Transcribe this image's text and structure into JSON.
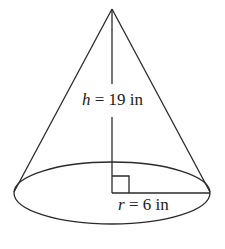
{
  "figure": {
    "shape": "right circular cone",
    "height": {
      "symbol": "h",
      "value": 19,
      "unit": "in",
      "equals": " = ",
      "value_text": "19 in"
    },
    "radius": {
      "symbol": "r",
      "value": 6,
      "unit": "in",
      "equals": " = ",
      "value_text": "6 in"
    },
    "right_angle_marker": true
  }
}
